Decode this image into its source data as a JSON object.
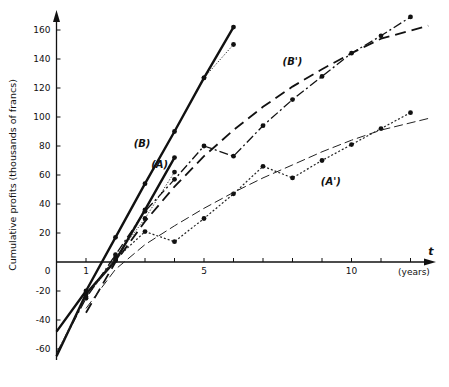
{
  "chart_data": {
    "type": "line",
    "title": "",
    "xlabel": "(years)",
    "x_axis_symbol": "t",
    "ylabel": "Cumulative profits (thousands of francs)",
    "xlim": [
      0,
      12.7
    ],
    "ylim": [
      -70,
      165
    ],
    "x_ticks": [
      1,
      2,
      3,
      4,
      5,
      6,
      7,
      8,
      9,
      10,
      11,
      12
    ],
    "x_tick_labels": {
      "0": "0",
      "1": "1",
      "5": "5",
      "10": "10"
    },
    "y_ticks": [
      -60,
      -40,
      -20,
      20,
      40,
      60,
      80,
      100,
      120,
      140,
      160
    ],
    "y_tick_labels": [
      "-60",
      "-40",
      "-20",
      "0",
      "20",
      "40",
      "60",
      "80",
      "100",
      "120",
      "140",
      "160"
    ],
    "grid": false,
    "legend": "inline labels",
    "series": [
      {
        "name": "(B)",
        "style": "thick-solid",
        "points": [
          [
            0,
            -48
          ],
          [
            1,
            -20
          ],
          [
            2,
            17
          ],
          [
            3,
            54
          ],
          [
            4,
            90
          ],
          [
            5,
            127
          ],
          [
            6,
            162
          ]
        ]
      },
      {
        "name": "(B) dotted branch",
        "style": "dotted",
        "points": [
          [
            5,
            127
          ],
          [
            6,
            150
          ]
        ]
      },
      {
        "name": "(A)",
        "style": "thick-solid",
        "points": [
          [
            0,
            -65
          ],
          [
            1,
            -22
          ],
          [
            2,
            1
          ],
          [
            3,
            36
          ],
          [
            4,
            72
          ]
        ]
      },
      {
        "name": "(A) dotted branch",
        "style": "dotted",
        "points": [
          [
            1,
            -22
          ],
          [
            2,
            3
          ],
          [
            3,
            30
          ],
          [
            4,
            62
          ]
        ]
      },
      {
        "name": "(B')",
        "style": "dash-dot",
        "points": [
          [
            0,
            -63
          ],
          [
            1,
            -25
          ],
          [
            2,
            5
          ],
          [
            3,
            35
          ],
          [
            4,
            57
          ],
          [
            5,
            80
          ],
          [
            6,
            73
          ],
          [
            7,
            94
          ],
          [
            8,
            112
          ],
          [
            9,
            128
          ],
          [
            10,
            144
          ],
          [
            11,
            156
          ],
          [
            12,
            169
          ]
        ]
      },
      {
        "name": "(B') fitted",
        "style": "long-dash",
        "points": [
          [
            1,
            -35
          ],
          [
            2,
            0
          ],
          [
            3,
            28
          ],
          [
            4,
            52
          ],
          [
            5,
            73
          ],
          [
            6,
            91
          ],
          [
            7,
            107
          ],
          [
            8,
            121
          ],
          [
            9,
            133
          ],
          [
            10,
            144
          ],
          [
            11,
            154
          ],
          [
            12.6,
            163
          ]
        ]
      },
      {
        "name": "(A')",
        "style": "dotted-dash",
        "points": [
          [
            0,
            -63
          ],
          [
            1,
            -24
          ],
          [
            2,
            2
          ],
          [
            3,
            21
          ],
          [
            4,
            14
          ],
          [
            5,
            30
          ],
          [
            6,
            47
          ],
          [
            7,
            66
          ],
          [
            8,
            58
          ],
          [
            9,
            70
          ],
          [
            10,
            81
          ],
          [
            11,
            92
          ],
          [
            12,
            103
          ]
        ]
      },
      {
        "name": "(A') fitted",
        "style": "thin-dash",
        "points": [
          [
            1,
            -32
          ],
          [
            2,
            -5
          ],
          [
            3,
            12
          ],
          [
            4,
            25
          ],
          [
            5,
            37
          ],
          [
            6,
            48
          ],
          [
            7,
            58
          ],
          [
            8,
            67
          ],
          [
            9,
            76
          ],
          [
            10,
            84
          ],
          [
            11,
            91
          ],
          [
            12.6,
            99
          ]
        ]
      }
    ],
    "annotations": [
      {
        "text": "(B)",
        "t": 2.9,
        "v": 79
      },
      {
        "text": "(A)",
        "t": 3.5,
        "v": 65
      },
      {
        "text": "(B')",
        "t": 8.0,
        "v": 136
      },
      {
        "text": "(A')",
        "t": 9.3,
        "v": 53
      }
    ]
  }
}
